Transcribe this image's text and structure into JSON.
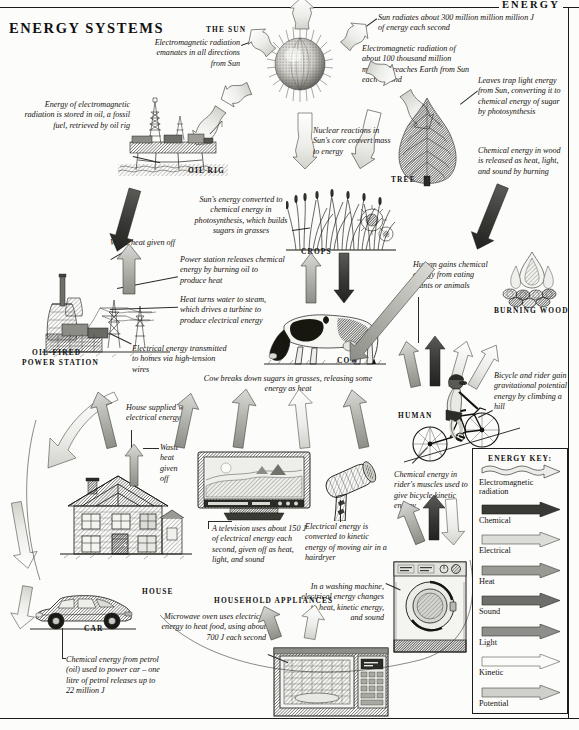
{
  "running_head": "ENERGY",
  "page_title": "ENERGY SYSTEMS",
  "labels": {
    "the_sun": "THE SUN",
    "oil_rig": "OIL RIG",
    "tree": "TREE",
    "crops": "CROPS",
    "cow": "COW",
    "burning_wood": "BURNING WOOD",
    "human": "HUMAN",
    "power_station_1": "OIL-FIRED",
    "power_station_2": "POWER STATION",
    "house": "HOUSE",
    "household_appliances": "HOUSEHOLD APPLIANCES",
    "car": "CAR"
  },
  "captions": {
    "em_radiation_sun": "Electromagnetic radiation emanates in all directions from Sun",
    "sun_radiates": "Sun radiates about 300 million million million J of energy each second",
    "em_reaches_earth": "Electromagnetic radiation of about 100 thousand million million J reaches Earth from Sun each second",
    "leaves_trap": "Leaves trap light energy from Sun, converting it to chemical energy of sugar by photosynthesis",
    "wood_released": "Chemical energy in wood is released as heat, light, and sound by burning",
    "oil_stored": "Energy of electromagnetic radiation is stored in oil, a fossil fuel, retrieved by oil rig",
    "nuclear_reactions": "Nuclear reactions in Sun's core convert mass to energy",
    "photosynthesis_grasses": "Sun's energy converted to chemical energy in photosynthesis, which builds sugars in grasses",
    "waste_heat_station": "Waste heat given off",
    "station_releases": "Power station releases chemical energy by burning oil to produce heat",
    "heat_turns_water": "Heat turns water to steam, which drives a turbine to produce electrical energy",
    "electricity_transmitted": "Electrical energy transmitted to homes via high-tension wires",
    "human_gains": "Human gains chemical energy from eating plants or animals",
    "cow_breaks_down": "Cow breaks down sugars in grasses, releasing some energy as heat",
    "bicycle_potential": "Bicycle and rider gain gravitational potential energy by climbing a hill",
    "house_supplied": "House supplied with electrical energy",
    "waste_heat_house": "Waste heat given off",
    "television": "A television uses about 150 J of electrical energy each second, given off as heat, light, and sound",
    "hairdryer": "Electrical energy is converted to kinetic energy of moving air in a hairdryer",
    "rider_muscles": "Chemical energy in rider's muscles used to give bicycle kinetic energy",
    "washing_machine": "In a washing machine, electrical energy changes to heat, kinetic energy, and sound",
    "microwave": "Microwave oven uses electrical energy to heat food, using about 700 J each second",
    "car_petrol": "Chemical energy from petrol (oil) used to power car – one litre of petrol releases up to 22 million J"
  },
  "energy_key": {
    "title": "ENERGY KEY:",
    "entries": [
      {
        "label": "Electromagnetic radiation",
        "style": "wavy",
        "color": "#e8e8e6"
      },
      {
        "label": "Chemical",
        "style": "solid",
        "color": "#3a3a38"
      },
      {
        "label": "Electrical",
        "style": "solid",
        "color": "#dcdcd8"
      },
      {
        "label": "Heat",
        "style": "solid",
        "color": "#9a9a95"
      },
      {
        "label": "Sound",
        "style": "solid",
        "color": "#6e6e6a"
      },
      {
        "label": "Light",
        "style": "solid",
        "color": "#8e8e8a"
      },
      {
        "label": "Kinetic",
        "style": "solid",
        "color": "#fafaf8"
      },
      {
        "label": "Potential",
        "style": "solid",
        "color": "#cfcfcb"
      }
    ]
  }
}
